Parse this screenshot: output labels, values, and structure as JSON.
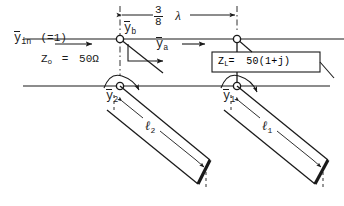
{
  "figure": {
    "type": "schematic-diagram",
    "ink_color": "#1a1a1a",
    "background_color": "#ffffff"
  },
  "labels": {
    "y_in": {
      "symbol": "y",
      "overbar": true,
      "subscript": "in",
      "value": "(=1)"
    },
    "z_o": {
      "text": "Z",
      "subscript": "o",
      "equals": "=",
      "value": "50Ω"
    },
    "y_b": {
      "symbol": "y",
      "overbar": true,
      "subscript": "b"
    },
    "y_a": {
      "symbol": "y",
      "overbar": true,
      "subscript": "a"
    },
    "y_1": {
      "symbol": "y",
      "overbar": true,
      "subscript": "1"
    },
    "y_2": {
      "symbol": "y",
      "overbar": true,
      "subscript": "2"
    },
    "spacing": {
      "numerator": "3",
      "denominator": "8",
      "unit": "λ"
    },
    "z_load": {
      "text": "Z",
      "subscript": "L",
      "equals": "=",
      "value": "50(1+j)"
    },
    "stub_1": {
      "symbol": "ℓ",
      "subscript": "1"
    },
    "stub_2": {
      "symbol": "ℓ",
      "subscript": "2"
    }
  },
  "elements": {
    "node_b": {
      "name": "junction-node-b",
      "x": 120,
      "y": 39
    },
    "node_load": {
      "name": "junction-node-load",
      "x": 237,
      "y": 39
    },
    "node_2": {
      "name": "junction-node-2",
      "x": 120,
      "y": 86
    },
    "node_1": {
      "name": "junction-node-1",
      "x": 237,
      "y": 86
    },
    "load_box": {
      "x": 212,
      "y": 52,
      "width": 108,
      "height": 20
    }
  }
}
